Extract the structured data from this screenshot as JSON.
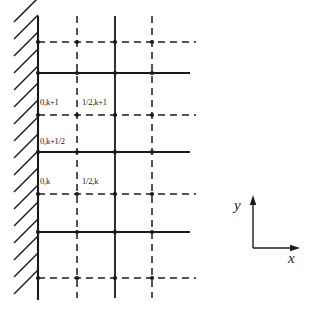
{
  "figure": {
    "name": "staggered-grid-boundary-diagram",
    "colors": {
      "line": "#1a1a1a",
      "background": "#ffffff",
      "hatch": "#1a1a1a",
      "text": "#1a1a1a"
    }
  },
  "boundary": {
    "name": "hatched-wall",
    "wall_x": 38,
    "hatch_left_x": 14,
    "top_y": 16,
    "bottom_y": 300,
    "hatch_count": 17,
    "hatch_spacing": 17
  },
  "grid": {
    "solid_columns_x": [
      38,
      115
    ],
    "dashed_columns_x": [
      77,
      152
    ],
    "column_top_y": 16,
    "column_bottom_y": 298,
    "solid_rows_y": [
      73,
      152,
      232
    ],
    "dashed_rows_y": [
      42,
      115,
      194,
      278
    ],
    "row_left_x": 38,
    "solid_row_right_x": 190,
    "dashed_row_right_x": 196,
    "node_radius": 2.1,
    "dash_pattern": "7,5"
  },
  "nodes": {
    "columns_x": [
      38,
      77,
      115,
      152
    ],
    "rows_y": [
      42,
      73,
      115,
      152,
      194,
      232,
      278
    ]
  },
  "labels": [
    {
      "id": "label-0-k-plus-1",
      "text": "0,k+1",
      "x": 40,
      "y": 98
    },
    {
      "id": "label-half-k-plus-1",
      "text": "1/2,k+1",
      "x": 82,
      "y": 98
    },
    {
      "id": "label-0-k-plus-half",
      "text": "0,k+1/2",
      "x": 40,
      "y": 137
    },
    {
      "id": "label-0-k",
      "text": "0,k",
      "x": 40,
      "y": 177
    },
    {
      "id": "label-half-k",
      "text": "1/2,k",
      "x": 82,
      "y": 177
    }
  ],
  "axes": {
    "name": "coordinate-axes",
    "origin_x": 253,
    "origin_y": 248,
    "y_tip_y": 199,
    "x_tip_x": 296,
    "y_label": "y",
    "x_label": "x",
    "y_label_x": 234,
    "y_label_y": 198,
    "x_label_x": 288,
    "x_label_y": 251
  }
}
